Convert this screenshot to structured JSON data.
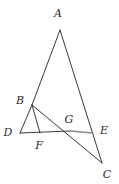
{
  "figure": {
    "width": 119,
    "height": 184,
    "background_color": "#ffffff",
    "stroke_color": "#3a3a3a",
    "accent_stroke_color": "#8a8a8a",
    "label_color": "#2b2b2b",
    "stroke_width": 1
  },
  "points": [
    {
      "name": "A",
      "x": 60,
      "y": 30,
      "label": "A",
      "label_x": 58,
      "label_y": 14
    },
    {
      "name": "B",
      "x": 32,
      "y": 105,
      "label": "B",
      "label_x": 20,
      "label_y": 101
    },
    {
      "name": "C",
      "x": 102,
      "y": 163,
      "label": "C",
      "label_x": 107,
      "label_y": 175
    },
    {
      "name": "D",
      "x": 20,
      "y": 133,
      "label": "D",
      "label_x": 8,
      "label_y": 133
    },
    {
      "name": "E",
      "x": 93,
      "y": 133,
      "label": "E",
      "label_x": 104,
      "label_y": 131
    },
    {
      "name": "F",
      "x": 40,
      "y": 133,
      "label": "F",
      "label_x": 39,
      "label_y": 146
    },
    {
      "name": "G",
      "x": 70,
      "y": 131,
      "label": "G",
      "label_x": 69,
      "label_y": 120
    }
  ],
  "segments": [
    {
      "name": "AB",
      "from": "A",
      "to": "B",
      "style": "solid",
      "color": "#3a3a3a"
    },
    {
      "name": "AC",
      "from": "A",
      "to": "C",
      "style": "solid",
      "color": "#3a3a3a"
    },
    {
      "name": "BC",
      "from": "B",
      "to": "C",
      "style": "solid",
      "color": "#3a3a3a"
    },
    {
      "name": "BD",
      "from": "B",
      "to": "D",
      "style": "solid",
      "color": "#3a3a3a"
    },
    {
      "name": "BF",
      "from": "B",
      "to": "F",
      "style": "solid",
      "color": "#3a3a3a"
    },
    {
      "name": "DG",
      "from": "D",
      "to": "G",
      "style": "solid",
      "color": "#3a3a3a"
    },
    {
      "name": "GE",
      "from": "G",
      "to": "E",
      "style": "solid",
      "color": "#8a8a8a"
    }
  ]
}
